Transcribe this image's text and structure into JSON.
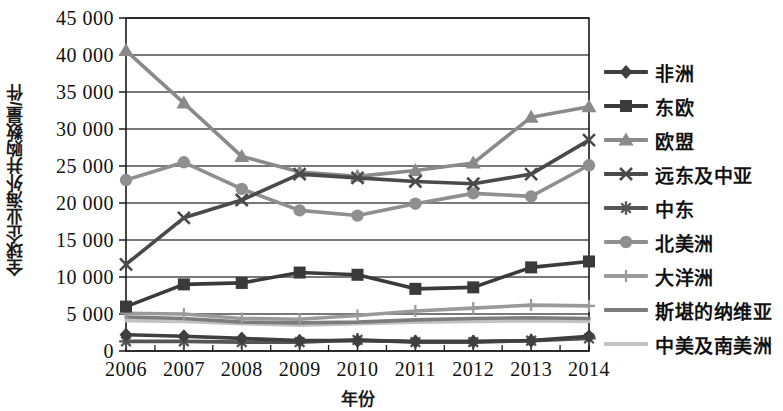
{
  "chart_data": {
    "type": "line",
    "title": "",
    "xlabel": "年份",
    "ylabel": "全球企业海外并购数量/件",
    "categories": [
      "2006",
      "2007",
      "2008",
      "2009",
      "2010",
      "2011",
      "2012",
      "2013",
      "2014"
    ],
    "x": [
      2006,
      2007,
      2008,
      2009,
      2010,
      2011,
      2012,
      2013,
      2014
    ],
    "ylim": [
      0,
      45000
    ],
    "ytick_labels": [
      "0",
      "5 000",
      "10 000",
      "15 000",
      "20 000",
      "25 000",
      "30 000",
      "35 000",
      "40 000",
      "45 000"
    ],
    "yticks": [
      0,
      5000,
      10000,
      15000,
      20000,
      25000,
      30000,
      35000,
      40000,
      45000
    ],
    "grid": true,
    "legend_position": "right",
    "series": [
      {
        "name": "非洲",
        "marker": "diamond",
        "color": "#3f3f3f",
        "values": [
          2200,
          2000,
          1700,
          1400,
          1400,
          1300,
          1300,
          1400,
          2000
        ]
      },
      {
        "name": "东欧",
        "marker": "square",
        "color": "#3a3a3a",
        "values": [
          6000,
          9000,
          9200,
          10600,
          10300,
          8400,
          8600,
          11300,
          12100
        ]
      },
      {
        "name": "欧盟",
        "marker": "triangle",
        "color": "#8a8a8a",
        "values": [
          40600,
          33500,
          26300,
          24200,
          23600,
          24400,
          25400,
          31600,
          33000
        ]
      },
      {
        "name": "远东及中亚",
        "marker": "cross",
        "color": "#4a4a4a",
        "values": [
          11700,
          18000,
          20400,
          23900,
          23400,
          22900,
          22600,
          23900,
          28500
        ]
      },
      {
        "name": "中东",
        "marker": "asterisk",
        "color": "#555555",
        "values": [
          1300,
          1300,
          1200,
          1200,
          1500,
          1200,
          1200,
          1400,
          1700
        ]
      },
      {
        "name": "北美洲",
        "marker": "circle",
        "color": "#8f8f8f",
        "values": [
          23100,
          25500,
          21900,
          19000,
          18300,
          19900,
          21300,
          20900,
          25100
        ]
      },
      {
        "name": "大洋洲",
        "marker": "plus",
        "color": "#9a9a9a",
        "values": [
          5100,
          5000,
          4400,
          4300,
          4800,
          5400,
          5800,
          6200,
          6100
        ]
      },
      {
        "name": "斯堪的纳维亚",
        "marker": "none",
        "color": "#7d7d7d",
        "values": [
          4600,
          4400,
          3900,
          3800,
          3900,
          4200,
          4400,
          4500,
          4400
        ]
      },
      {
        "name": "中美及南美洲",
        "marker": "none",
        "color": "#c2c2c2",
        "values": [
          4100,
          4000,
          3700,
          3500,
          3700,
          3900,
          4000,
          4100,
          4000
        ]
      }
    ]
  },
  "axes": {
    "y_title": "全球企业海外并购数量/件",
    "x_title": "年份"
  },
  "colors": {
    "axis": "#1a1a1a",
    "grid": "#4d4d4d",
    "background": "#ffffff"
  }
}
